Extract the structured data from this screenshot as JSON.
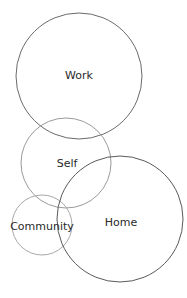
{
  "diagram": {
    "type": "overlapping-circles",
    "circles": [
      {
        "id": "work",
        "label": "Work",
        "cx": 79,
        "cy": 76,
        "r": 63,
        "stroke": "#6a6a6a",
        "label_x": 79,
        "label_y": 79
      },
      {
        "id": "self",
        "label": "Self",
        "cx": 66,
        "cy": 163,
        "r": 45,
        "stroke": "#9a9a9a",
        "label_x": 67,
        "label_y": 167
      },
      {
        "id": "community",
        "label": "Community",
        "cx": 42,
        "cy": 225,
        "r": 30,
        "stroke": "#a8a8a8",
        "label_x": 42,
        "label_y": 230
      },
      {
        "id": "home",
        "label": "Home",
        "cx": 120,
        "cy": 219,
        "r": 63,
        "stroke": "#5a5a5a",
        "label_x": 121,
        "label_y": 226
      }
    ]
  }
}
